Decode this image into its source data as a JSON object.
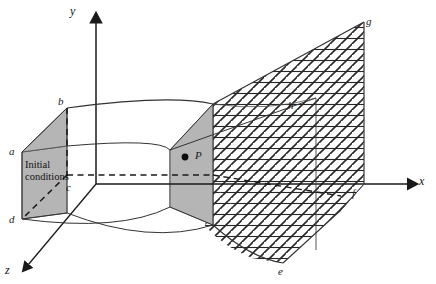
{
  "figure": {
    "kind": "3d-domain-diagram",
    "background_color": "#ffffff",
    "line_color": "#333333",
    "shade_color": "#b3b3b3",
    "hatch_color": "#1a1a1a"
  },
  "axes": {
    "x_label": "x",
    "y_label": "y",
    "z_label": "z"
  },
  "annotations": {
    "initial_conditions_line1": "Initial",
    "initial_conditions_line2": "conditions",
    "point_p": "P"
  },
  "vertices": {
    "a": "a",
    "b": "b",
    "c": "c",
    "d": "d",
    "e": "e",
    "f": "f",
    "g": "g",
    "h": "h"
  }
}
